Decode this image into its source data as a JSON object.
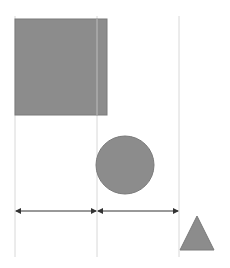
{
  "diagram": {
    "type": "shape-spacing-guides",
    "background": "#ffffff",
    "guide_color": "#d8d8d8",
    "shape_fill": "#8c8c8c",
    "shape_stroke": "#7a7a7a",
    "arrow_color": "#333333",
    "guides": [
      {
        "x": 15,
        "y1": 16,
        "y2": 257
      },
      {
        "x": 97,
        "y1": 16,
        "y2": 257
      },
      {
        "x": 179,
        "y1": 16,
        "y2": 257
      }
    ],
    "shapes": [
      {
        "kind": "square",
        "x": 15,
        "y": 19,
        "w": 92,
        "h": 96
      },
      {
        "kind": "circle",
        "cx": 125,
        "cy": 165,
        "r": 29
      },
      {
        "kind": "triangle",
        "points": "197,216 180,250 214,250"
      }
    ],
    "dimension_arrows": [
      {
        "x1": 16,
        "x2": 96,
        "y": 211
      },
      {
        "x1": 98,
        "x2": 178,
        "y": 211
      }
    ]
  }
}
